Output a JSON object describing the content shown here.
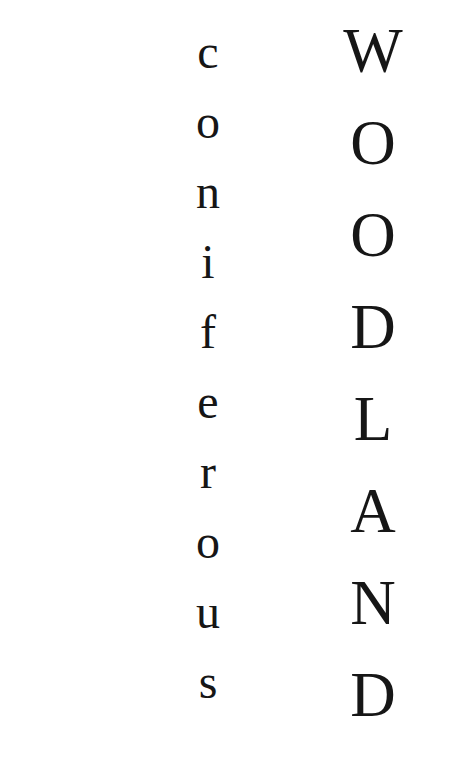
{
  "page": {
    "background_color": "#ffffff",
    "text_color": "#161616",
    "width": 470,
    "height": 784
  },
  "columns": [
    {
      "name": "coniferous",
      "word": "coniferous",
      "case": "lowercase",
      "orientation": "vertical-stacked-letters",
      "letters": [
        "c",
        "o",
        "n",
        "i",
        "f",
        "e",
        "r",
        "o",
        "u",
        "s"
      ]
    },
    {
      "name": "woodland",
      "word": "WOODLAND",
      "case": "uppercase",
      "orientation": "vertical-stacked-letters",
      "letters": [
        "W",
        "O",
        "O",
        "D",
        "L",
        "A",
        "N",
        "D"
      ]
    }
  ]
}
